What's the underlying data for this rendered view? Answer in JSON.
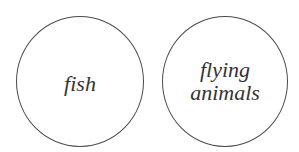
{
  "diagram": {
    "type": "disjoint-circles",
    "circles": [
      {
        "id": "fish",
        "label_lines": [
          "fish"
        ]
      },
      {
        "id": "flying-animals",
        "label_lines": [
          "flying",
          "animals"
        ]
      }
    ],
    "colors": {
      "stroke": "#4a4a4a",
      "text": "#333333",
      "background": "#ffffff"
    }
  }
}
